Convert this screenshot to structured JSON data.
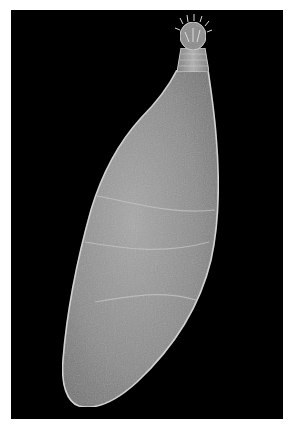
{
  "figure": {
    "background_color": "#000000",
    "specimen_color": "#9a9a9a",
    "specimen_highlight_color": "#d8d8d8",
    "page_color": "#ffffff"
  },
  "caption": {
    "text": ""
  }
}
